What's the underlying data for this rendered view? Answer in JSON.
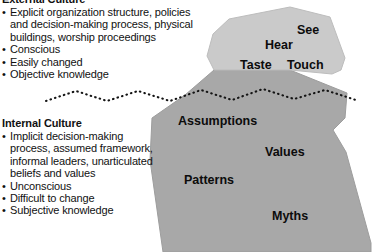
{
  "diagram": {
    "colors": {
      "tip_fill": "#c9c9c9",
      "body_fill": "#a8a8a8",
      "outline": "#8f8f8f",
      "text": "#0c0c0c",
      "waterline": "#1a1a1a",
      "background": "#ffffff"
    }
  },
  "external": {
    "heading": "External Culture",
    "bullet_glyph": "•",
    "bullets": [
      "Explicit organization structure, policies and decision-making process, physical buildings, worship proceedings",
      "Conscious",
      "Easily changed",
      "Objective knowledge"
    ]
  },
  "internal": {
    "heading": "Internal Culture",
    "bullet_glyph": "•",
    "bullets": [
      "Implicit decision-making process, assumed framework, informal leaders, unarticulated beliefs and values",
      "Unconscious",
      "Difficult to change",
      "Subjective knowledge"
    ]
  },
  "iceberg": {
    "tip_labels": [
      {
        "id": "see",
        "text": "See"
      },
      {
        "id": "hear",
        "text": "Hear"
      },
      {
        "id": "taste",
        "text": "Taste"
      },
      {
        "id": "touch",
        "text": "Touch"
      }
    ],
    "body_labels": [
      {
        "id": "assumptions",
        "text": "Assumptions"
      },
      {
        "id": "values",
        "text": "Values"
      },
      {
        "id": "patterns",
        "text": "Patterns"
      },
      {
        "id": "myths",
        "text": "Myths"
      }
    ]
  }
}
